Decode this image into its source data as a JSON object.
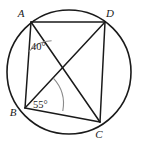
{
  "figure": {
    "kind": "cyclic-quadrilateral-with-diagonals",
    "stroke_color": "#1a1a1a",
    "arc_color": "#8a8a8a",
    "background_color": "#ffffff",
    "circle": {
      "cx": 69,
      "cy": 72,
      "r": 62
    },
    "vertices": [
      {
        "id": "A",
        "label": "A",
        "x": 31,
        "y": 22,
        "label_x": 21,
        "label_y": 17
      },
      {
        "id": "D",
        "label": "D",
        "x": 105,
        "y": 22,
        "label_x": 110,
        "label_y": 17
      },
      {
        "id": "B",
        "label": "B",
        "x": 25,
        "y": 108,
        "label_x": 13,
        "label_y": 116
      },
      {
        "id": "C",
        "label": "C",
        "x": 100,
        "y": 122,
        "label_x": 99,
        "label_y": 138
      }
    ],
    "sides": [
      {
        "name": "side-AD",
        "from": "A",
        "to": "D",
        "x1": 31,
        "y1": 22,
        "x2": 105,
        "y2": 22
      },
      {
        "name": "side-AB",
        "from": "A",
        "to": "B",
        "x1": 31,
        "y1": 22,
        "x2": 25,
        "y2": 108
      },
      {
        "name": "side-BC",
        "from": "B",
        "to": "C",
        "x1": 25,
        "y1": 108,
        "x2": 100,
        "y2": 122
      },
      {
        "name": "side-DC",
        "from": "D",
        "to": "C",
        "x1": 105,
        "y1": 22,
        "x2": 100,
        "y2": 122
      }
    ],
    "diagonals": [
      {
        "name": "diagonal-AC",
        "from": "A",
        "to": "C",
        "x1": 31,
        "y1": 22,
        "x2": 100,
        "y2": 122
      },
      {
        "name": "diagonal-BD",
        "from": "B",
        "to": "D",
        "x1": 25,
        "y1": 108,
        "x2": 105,
        "y2": 22
      }
    ],
    "angles": [
      {
        "name": "angle-at-A",
        "label": "40°",
        "value": 40,
        "unit": "degrees",
        "vertex": "A",
        "between": [
          "AB",
          "AC"
        ],
        "arc_path": "M 28.9 51.5 A 30 30 0 0 1 51.6 40.7",
        "label_x": 31,
        "label_y": 50
      },
      {
        "name": "angle-at-B",
        "label": "55°",
        "value": 55,
        "unit": "degrees",
        "vertex": "B",
        "between": [
          "BD",
          "BC"
        ],
        "arc_path": "M 53.3 78.2 A 38 38 0 0 1 62.8 111.0",
        "label_x": 33,
        "label_y": 108
      }
    ]
  }
}
